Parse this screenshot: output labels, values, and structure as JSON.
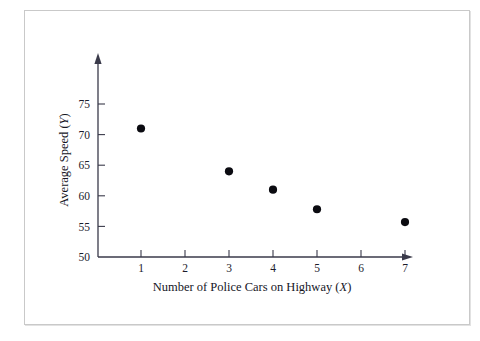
{
  "figure": {
    "frame_border_color": "#c9c9c9",
    "background_color": "#ffffff"
  },
  "chart_data": {
    "type": "scatter",
    "title": "",
    "xlabel": "Number of Police Cars on Highway (X)",
    "xlabel_main": "Number of Police Cars on Highway (",
    "xlabel_var": "X",
    "xlabel_close": ")",
    "ylabel": "Average Speed (Y)",
    "ylabel_main": "Average Speed (",
    "ylabel_var": "Y",
    "ylabel_close": ")",
    "x": [
      1,
      3,
      4,
      5,
      7
    ],
    "y": [
      71,
      64,
      61,
      57.8,
      55.7
    ],
    "points": [
      {
        "x": 1,
        "y": 71
      },
      {
        "x": 3,
        "y": 64
      },
      {
        "x": 4,
        "y": 61
      },
      {
        "x": 5,
        "y": 57.8
      },
      {
        "x": 7,
        "y": 55.7
      }
    ],
    "xlim": [
      0,
      7.6
    ],
    "ylim": [
      50,
      77
    ],
    "xticks": [
      1,
      2,
      3,
      4,
      5,
      6,
      7
    ],
    "xtick_labels": [
      "1",
      "2",
      "3",
      "4",
      "5",
      "6",
      "7"
    ],
    "yticks": [
      50,
      55,
      60,
      65,
      70,
      75
    ],
    "ytick_labels": [
      "50",
      "55",
      "60",
      "65",
      "70",
      "75"
    ],
    "grid": false,
    "legend": null,
    "marker": "filled-circle",
    "marker_color": "#0b0b11",
    "axis_color": "#3a3a4a",
    "x_axis_arrow": true,
    "y_axis_arrow": true
  }
}
